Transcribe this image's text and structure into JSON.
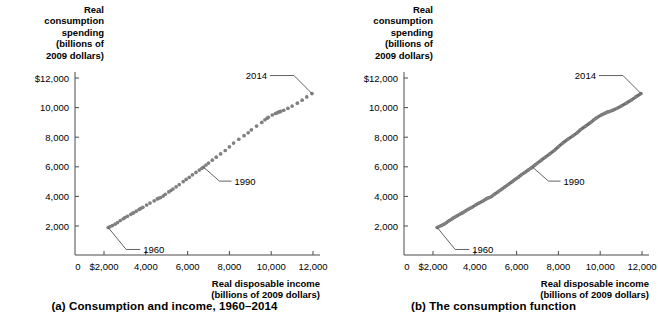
{
  "figure": {
    "panels": [
      {
        "id": "a",
        "caption": "(a) Consumption and income, 1960–2014",
        "y_axis_title": "Real\nconsumption\nspending\n(billions of\n2009 dollars)",
        "x_axis_title": "Real disposable income\n(billions of 2009 dollars)",
        "annotations": [
          {
            "label": "1960"
          },
          {
            "label": "1990"
          },
          {
            "label": "2014"
          }
        ]
      },
      {
        "id": "b",
        "caption": "(b) The consumption function",
        "y_axis_title": "Real\nconsumption\nspending\n(billions of\n2009 dollars)",
        "x_axis_title": "Real disposable income\n(billions of 2009 dollars)",
        "annotations": [
          {
            "label": "1960"
          },
          {
            "label": "1990"
          },
          {
            "label": "2014"
          }
        ]
      }
    ],
    "colors": {
      "marker": "#808080",
      "line": "#6e6e6e",
      "axis": "#4a4a4a",
      "text": "#000000"
    }
  },
  "chart_data": [
    {
      "type": "scatter",
      "title": "(a) Consumption and income, 1960–2014",
      "xlabel": "Real disposable income (billions of 2009 dollars)",
      "ylabel": "Real consumption spending (billions of 2009 dollars)",
      "xlim": [
        0,
        12800
      ],
      "ylim": [
        0,
        12800
      ],
      "xticks": [
        0,
        2000,
        4000,
        6000,
        8000,
        10000,
        12000
      ],
      "xticklabels": [
        "0",
        "$2,000",
        "4,000",
        "6,000",
        "8,000",
        "10,000",
        "12,000"
      ],
      "yticks": [
        2000,
        4000,
        6000,
        8000,
        10000,
        12000
      ],
      "yticklabels": [
        "2,000",
        "4,000",
        "6,000",
        "8,000",
        "10,000",
        "$12,000"
      ],
      "grid": false,
      "legend": null,
      "series": [
        {
          "name": "Consumption vs. disposable income, 1960–2014",
          "points": [
            [
              2200,
              1900
            ],
            [
              2290,
              1960
            ],
            [
              2400,
              2030
            ],
            [
              2530,
              2120
            ],
            [
              2650,
              2230
            ],
            [
              2780,
              2370
            ],
            [
              2920,
              2490
            ],
            [
              3000,
              2570
            ],
            [
              3120,
              2660
            ],
            [
              3280,
              2790
            ],
            [
              3380,
              2870
            ],
            [
              3420,
              2890
            ],
            [
              3540,
              3000
            ],
            [
              3680,
              3120
            ],
            [
              3760,
              3190
            ],
            [
              3860,
              3260
            ],
            [
              4040,
              3420
            ],
            [
              4200,
              3550
            ],
            [
              4400,
              3700
            ],
            [
              4550,
              3830
            ],
            [
              4600,
              3870
            ],
            [
              4700,
              3920
            ],
            [
              4830,
              4020
            ],
            [
              4930,
              4140
            ],
            [
              5100,
              4300
            ],
            [
              5200,
              4400
            ],
            [
              5300,
              4500
            ],
            [
              5450,
              4650
            ],
            [
              5600,
              4800
            ],
            [
              5790,
              5000
            ],
            [
              5930,
              5150
            ],
            [
              6080,
              5290
            ],
            [
              6230,
              5460
            ],
            [
              6400,
              5620
            ],
            [
              6560,
              5780
            ],
            [
              6680,
              5900
            ],
            [
              6760,
              5980
            ],
            [
              6880,
              6120
            ],
            [
              7000,
              6250
            ],
            [
              7180,
              6450
            ],
            [
              7370,
              6650
            ],
            [
              7580,
              6870
            ],
            [
              7800,
              7100
            ],
            [
              8000,
              7350
            ],
            [
              8200,
              7600
            ],
            [
              8450,
              7860
            ],
            [
              8700,
              8100
            ],
            [
              8900,
              8300
            ],
            [
              9050,
              8500
            ],
            [
              9300,
              8750
            ],
            [
              9550,
              9000
            ],
            [
              9700,
              9180
            ],
            [
              9800,
              9280
            ],
            [
              9860,
              9340
            ],
            [
              10050,
              9500
            ],
            [
              10200,
              9600
            ],
            [
              10280,
              9650
            ],
            [
              10350,
              9700
            ],
            [
              10400,
              9720
            ],
            [
              10450,
              9740
            ],
            [
              10600,
              9820
            ],
            [
              10800,
              9950
            ],
            [
              11000,
              10100
            ],
            [
              11250,
              10300
            ],
            [
              11480,
              10500
            ],
            [
              11700,
              10720
            ],
            [
              11950,
              10950
            ]
          ],
          "annotated": [
            {
              "label": "1960",
              "x": 2200,
              "y": 1900
            },
            {
              "label": "1990",
              "x": 6760,
              "y": 5980
            },
            {
              "label": "2014",
              "x": 11950,
              "y": 10950
            }
          ]
        }
      ]
    },
    {
      "type": "line",
      "title": "(b) The consumption function",
      "xlabel": "Real disposable income (billions of 2009 dollars)",
      "ylabel": "Real consumption spending (billions of 2009 dollars)",
      "xlim": [
        0,
        12800
      ],
      "ylim": [
        0,
        12800
      ],
      "xticks": [
        0,
        2000,
        4000,
        6000,
        8000,
        10000,
        12000
      ],
      "xticklabels": [
        "0",
        "$2,000",
        "4,000",
        "6,000",
        "8,000",
        "10,000",
        "12,000"
      ],
      "yticks": [
        2000,
        4000,
        6000,
        8000,
        10000,
        12000
      ],
      "yticklabels": [
        "2,000",
        "4,000",
        "6,000",
        "8,000",
        "10,000",
        "$12,000"
      ],
      "grid": false,
      "legend": null,
      "series": [
        {
          "name": "The consumption function",
          "points": [
            [
              2200,
              1900
            ],
            [
              2290,
              1960
            ],
            [
              2400,
              2030
            ],
            [
              2530,
              2120
            ],
            [
              2650,
              2230
            ],
            [
              2780,
              2370
            ],
            [
              2920,
              2490
            ],
            [
              3000,
              2570
            ],
            [
              3120,
              2660
            ],
            [
              3280,
              2790
            ],
            [
              3380,
              2870
            ],
            [
              3420,
              2890
            ],
            [
              3540,
              3000
            ],
            [
              3680,
              3120
            ],
            [
              3760,
              3190
            ],
            [
              3860,
              3260
            ],
            [
              4040,
              3420
            ],
            [
              4200,
              3550
            ],
            [
              4400,
              3700
            ],
            [
              4550,
              3830
            ],
            [
              4600,
              3870
            ],
            [
              4700,
              3920
            ],
            [
              4830,
              4020
            ],
            [
              4930,
              4140
            ],
            [
              5100,
              4300
            ],
            [
              5200,
              4400
            ],
            [
              5300,
              4500
            ],
            [
              5450,
              4650
            ],
            [
              5600,
              4800
            ],
            [
              5790,
              5000
            ],
            [
              5930,
              5150
            ],
            [
              6080,
              5290
            ],
            [
              6230,
              5460
            ],
            [
              6400,
              5620
            ],
            [
              6560,
              5780
            ],
            [
              6680,
              5900
            ],
            [
              6760,
              5980
            ],
            [
              6880,
              6120
            ],
            [
              7000,
              6250
            ],
            [
              7180,
              6450
            ],
            [
              7370,
              6650
            ],
            [
              7580,
              6870
            ],
            [
              7800,
              7100
            ],
            [
              8000,
              7350
            ],
            [
              8200,
              7600
            ],
            [
              8450,
              7860
            ],
            [
              8700,
              8100
            ],
            [
              8900,
              8300
            ],
            [
              9050,
              8500
            ],
            [
              9300,
              8750
            ],
            [
              9550,
              9000
            ],
            [
              9700,
              9180
            ],
            [
              9800,
              9280
            ],
            [
              9860,
              9340
            ],
            [
              10050,
              9500
            ],
            [
              10200,
              9600
            ],
            [
              10280,
              9650
            ],
            [
              10350,
              9700
            ],
            [
              10400,
              9720
            ],
            [
              10450,
              9740
            ],
            [
              10600,
              9820
            ],
            [
              10800,
              9950
            ],
            [
              11000,
              10100
            ],
            [
              11250,
              10300
            ],
            [
              11480,
              10500
            ],
            [
              11700,
              10720
            ],
            [
              11950,
              10950
            ]
          ],
          "annotated": [
            {
              "label": "1960",
              "x": 2200,
              "y": 1900
            },
            {
              "label": "1990",
              "x": 6760,
              "y": 5980
            },
            {
              "label": "2014",
              "x": 11950,
              "y": 10950
            }
          ]
        }
      ]
    }
  ]
}
